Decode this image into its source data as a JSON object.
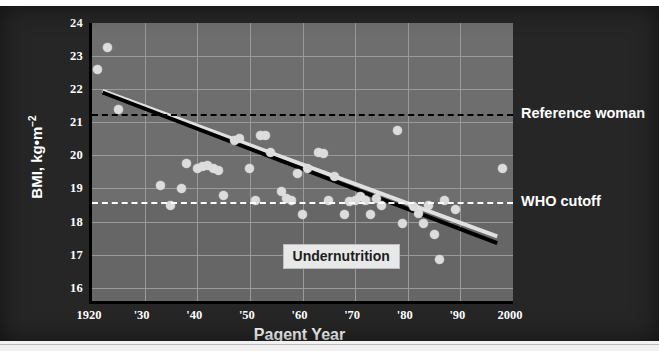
{
  "chart_data": {
    "type": "scatter",
    "title": "",
    "xlabel": "Pagent Year",
    "ylabel": "BMI, kg•m",
    "ylabel_exponent": "−2",
    "xlim": [
      1920,
      2000
    ],
    "ylim": [
      15.6,
      24
    ],
    "grid": true,
    "legend_position": "right-outside",
    "xticks": [
      {
        "value": 1920,
        "label": "1920"
      },
      {
        "value": 1930,
        "label": "'30"
      },
      {
        "value": 1940,
        "label": "'40"
      },
      {
        "value": 1950,
        "label": "'50"
      },
      {
        "value": 1960,
        "label": "'60"
      },
      {
        "value": 1970,
        "label": "'70"
      },
      {
        "value": 1980,
        "label": "'80"
      },
      {
        "value": 1990,
        "label": "'90"
      },
      {
        "value": 2000,
        "label": "2000"
      }
    ],
    "yticks": [
      {
        "value": 24,
        "label": "24"
      },
      {
        "value": 23,
        "label": "23"
      },
      {
        "value": 22,
        "label": "22"
      },
      {
        "value": 21,
        "label": "21"
      },
      {
        "value": 20,
        "label": "20"
      },
      {
        "value": 19,
        "label": "19"
      },
      {
        "value": 18,
        "label": "18"
      },
      {
        "value": 17,
        "label": "17"
      },
      {
        "value": 16,
        "label": "16"
      }
    ],
    "reference_lines": [
      {
        "name": "Reference woman",
        "y": 21.25,
        "style": "dashed",
        "color": "#000000",
        "label": "Reference woman"
      },
      {
        "name": "WHO cutoff",
        "y": 18.6,
        "style": "dashed",
        "color": "#ffffff",
        "label": "WHO cutoff"
      }
    ],
    "annotations": [
      {
        "name": "Undernutrition",
        "text": "Undernutrition",
        "x": 1968,
        "y": 16.95
      }
    ],
    "trend_line": {
      "name": "linear regression",
      "x": [
        1922,
        1997
      ],
      "y": [
        21.9,
        17.35
      ],
      "color": "#000000"
    },
    "trend_line_shadow": {
      "name": "highlight offset line",
      "x": [
        1922,
        1997
      ],
      "y": [
        21.95,
        17.55
      ],
      "color": "#e0e0e0"
    },
    "series": [
      {
        "name": "Miss America BMI",
        "marker": "circle",
        "color": "#dcdcdc",
        "points": [
          {
            "x": 1921,
            "y": 22.6
          },
          {
            "x": 1923,
            "y": 23.25
          },
          {
            "x": 1925,
            "y": 21.4
          },
          {
            "x": 1933,
            "y": 19.1
          },
          {
            "x": 1935,
            "y": 18.5
          },
          {
            "x": 1937,
            "y": 19.0
          },
          {
            "x": 1938,
            "y": 19.75
          },
          {
            "x": 1940,
            "y": 19.6
          },
          {
            "x": 1941,
            "y": 19.65
          },
          {
            "x": 1942,
            "y": 19.7
          },
          {
            "x": 1943,
            "y": 19.6
          },
          {
            "x": 1944,
            "y": 19.55
          },
          {
            "x": 1945,
            "y": 18.8
          },
          {
            "x": 1947,
            "y": 20.45
          },
          {
            "x": 1948,
            "y": 20.5
          },
          {
            "x": 1950,
            "y": 19.6
          },
          {
            "x": 1951,
            "y": 18.65
          },
          {
            "x": 1952,
            "y": 20.6
          },
          {
            "x": 1953,
            "y": 20.6
          },
          {
            "x": 1954,
            "y": 20.1
          },
          {
            "x": 1956,
            "y": 18.9
          },
          {
            "x": 1957,
            "y": 18.7
          },
          {
            "x": 1958,
            "y": 18.65
          },
          {
            "x": 1959,
            "y": 19.45
          },
          {
            "x": 1960,
            "y": 18.2
          },
          {
            "x": 1961,
            "y": 19.6
          },
          {
            "x": 1963,
            "y": 20.1
          },
          {
            "x": 1964,
            "y": 20.05
          },
          {
            "x": 1965,
            "y": 18.65
          },
          {
            "x": 1966,
            "y": 19.35
          },
          {
            "x": 1968,
            "y": 18.2
          },
          {
            "x": 1969,
            "y": 18.6
          },
          {
            "x": 1970,
            "y": 18.65
          },
          {
            "x": 1971,
            "y": 18.75
          },
          {
            "x": 1972,
            "y": 18.65
          },
          {
            "x": 1973,
            "y": 18.2
          },
          {
            "x": 1974,
            "y": 18.7
          },
          {
            "x": 1975,
            "y": 18.5
          },
          {
            "x": 1978,
            "y": 20.75
          },
          {
            "x": 1979,
            "y": 17.95
          },
          {
            "x": 1981,
            "y": 18.45
          },
          {
            "x": 1982,
            "y": 18.25
          },
          {
            "x": 1983,
            "y": 17.95
          },
          {
            "x": 1984,
            "y": 18.5
          },
          {
            "x": 1985,
            "y": 17.6
          },
          {
            "x": 1986,
            "y": 16.85
          },
          {
            "x": 1987,
            "y": 18.65
          },
          {
            "x": 1989,
            "y": 18.35
          },
          {
            "x": 1998,
            "y": 19.6
          }
        ]
      }
    ]
  }
}
